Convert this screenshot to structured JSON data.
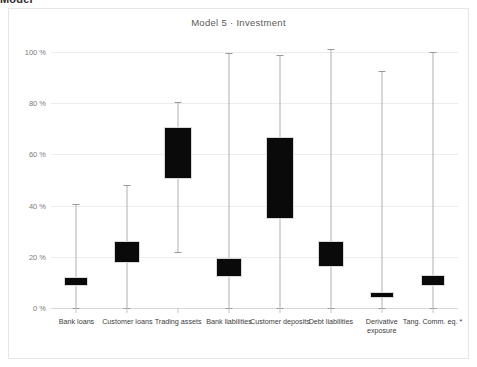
{
  "clipped_header_text": "Model",
  "chart_data": {
    "type": "bar",
    "subtype": "box-whisker",
    "title": "Model 5  ·  Investment",
    "xlabel": "",
    "ylabel": "",
    "ylim": [
      0,
      105
    ],
    "grid": true,
    "legend": null,
    "y_ticks": [
      {
        "value": 0,
        "label": "0 %"
      },
      {
        "value": 20,
        "label": "20 %"
      },
      {
        "value": 40,
        "label": "40 %"
      },
      {
        "value": 60,
        "label": "60 %"
      },
      {
        "value": 80,
        "label": "80 %"
      },
      {
        "value": 100,
        "label": "100 %"
      }
    ],
    "categories": [
      "Bank loans",
      "Customer loans",
      "Trading assets",
      "Bank liabilities",
      "Customer deposits",
      "Debt liabilities",
      "Derivative exposure",
      "Tang. Comm. eq. *"
    ],
    "boxes": [
      {
        "category": "Bank loans",
        "whisker_low": 0.0,
        "box_low": 8.6,
        "box_high": 12.1,
        "whisker_high": 40.6
      },
      {
        "category": "Customer loans",
        "whisker_low": 0.0,
        "box_low": 17.6,
        "box_high": 26.2,
        "whisker_high": 48.0
      },
      {
        "category": "Trading assets",
        "whisker_low": 21.9,
        "box_low": 50.4,
        "box_high": 70.7,
        "whisker_high": 80.5
      },
      {
        "category": "Bank liabilities",
        "whisker_low": 0.0,
        "box_low": 12.1,
        "box_high": 19.5,
        "whisker_high": 99.6
      },
      {
        "category": "Customer deposits",
        "whisker_low": 0.0,
        "box_low": 34.8,
        "box_high": 66.8,
        "whisker_high": 98.8
      },
      {
        "category": "Debt liabilities",
        "whisker_low": 0.0,
        "box_low": 16.0,
        "box_high": 26.2,
        "whisker_high": 101.0
      },
      {
        "category": "Derivative exposure",
        "whisker_low": 0.0,
        "box_low": 4.0,
        "box_high": 6.3,
        "whisker_high": 92.6
      },
      {
        "category": "Tang. Comm. eq. *",
        "whisker_low": 0.0,
        "box_low": 8.6,
        "box_high": 13.0,
        "whisker_high": 100.0
      }
    ],
    "colors": {
      "box_fill": "#0a0a0a",
      "whisker": "#b0b0b0",
      "grid": "#ececec",
      "tick_label": "#7d7d7d",
      "category_label": "#3d3d3d",
      "title": "#5a5a5a",
      "background": "#ffffff"
    }
  }
}
